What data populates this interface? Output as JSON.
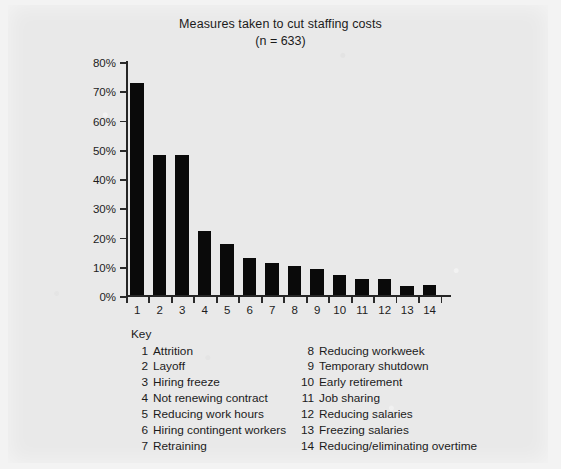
{
  "chart_data": {
    "type": "bar",
    "title": "Measures taken to cut staffing costs",
    "subtitle": "(n = 633)",
    "xlabel": "",
    "ylabel": "",
    "ylim": [
      0,
      80
    ],
    "grid": false,
    "legend_position": "below-as-key",
    "categories": [
      "1",
      "2",
      "3",
      "4",
      "5",
      "6",
      "7",
      "8",
      "9",
      "10",
      "11",
      "12",
      "13",
      "14"
    ],
    "values": [
      72.5,
      48,
      48,
      22,
      17.5,
      12.5,
      11,
      10,
      9,
      7,
      5.5,
      5.5,
      3,
      3.5
    ],
    "ytick_labels": [
      "0%",
      "10%",
      "20%",
      "30%",
      "40%",
      "50%",
      "60%",
      "70%",
      "80%"
    ],
    "ytick_values": [
      0,
      10,
      20,
      30,
      40,
      50,
      60,
      70,
      80
    ],
    "xtick_labels": [
      "1",
      "2",
      "3",
      "4",
      "5",
      "6",
      "7",
      "8",
      "9",
      "10",
      "11",
      "12",
      "13",
      "14"
    ],
    "bar_color": "#0a0a0a",
    "background_color": "#e9e9e9",
    "category_labels": [
      "Attrition",
      "Layoff",
      "Hiring freeze",
      "Not renewing contract",
      "Reducing work hours",
      "Hiring contingent workers",
      "Retraining",
      "Reducing workweek",
      "Temporary shutdown",
      "Early retirement",
      "Job sharing",
      "Reducing salaries",
      "Freezing salaries",
      "Reducing/eliminating overtime"
    ]
  },
  "key": {
    "heading": "Key",
    "left_column": [
      {
        "num": "1",
        "label": "Attrition"
      },
      {
        "num": "2",
        "label": "Layoff"
      },
      {
        "num": "3",
        "label": "Hiring freeze"
      },
      {
        "num": "4",
        "label": "Not renewing contract"
      },
      {
        "num": "5",
        "label": "Reducing work hours"
      },
      {
        "num": "6",
        "label": "Hiring contingent workers"
      },
      {
        "num": "7",
        "label": "Retraining"
      }
    ],
    "right_column": [
      {
        "num": "8",
        "label": "Reducing workweek"
      },
      {
        "num": "9",
        "label": "Temporary shutdown"
      },
      {
        "num": "10",
        "label": "Early retirement"
      },
      {
        "num": "11",
        "label": "Job sharing"
      },
      {
        "num": "12",
        "label": "Reducing salaries"
      },
      {
        "num": "13",
        "label": "Freezing salaries"
      },
      {
        "num": "14",
        "label": "Reducing/eliminating overtime"
      }
    ]
  }
}
